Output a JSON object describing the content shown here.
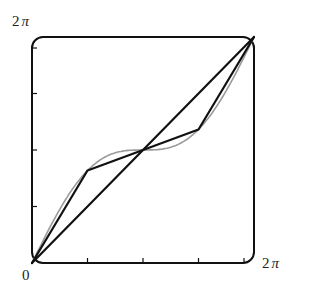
{
  "chart_data": {
    "type": "line",
    "title": "",
    "xlabel": "",
    "ylabel": "",
    "xlim": [
      0,
      6.2832
    ],
    "ylim": [
      0,
      6.2832
    ],
    "grid": false,
    "legend": null,
    "tick_labels": {
      "origin": "0",
      "x_max": "2",
      "y_max": "2",
      "pi_symbol": "π"
    },
    "x_ticks": [
      1.5708,
      3.1416,
      4.7124,
      6.2832
    ],
    "y_ticks": [
      1.5708,
      3.1416,
      4.7124,
      6.2832
    ],
    "series": [
      {
        "name": "diagonal y = x",
        "color": "#111111",
        "width": 2.2,
        "x": [
          0,
          6.2832
        ],
        "y": [
          0,
          6.2832
        ]
      },
      {
        "name": "piecewise-linear interpolant of x + sin(x)",
        "color": "#111111",
        "width": 2.2,
        "x": [
          0,
          1.5708,
          3.1416,
          4.7124,
          6.2832
        ],
        "y": [
          0,
          2.5708,
          3.1416,
          3.7124,
          6.2832
        ]
      },
      {
        "name": "curve y = x + sin(x)",
        "color": "#9a9a9a",
        "width": 1.6,
        "function": "x+sin(x)",
        "samples": 120
      }
    ]
  },
  "labels": {
    "y_top_num": "2",
    "x_right_num": "2",
    "pi": "π",
    "origin": "0"
  },
  "colors": {
    "frame": "#111111",
    "ink": "#111111",
    "smooth_curve": "#9a9a9a"
  }
}
